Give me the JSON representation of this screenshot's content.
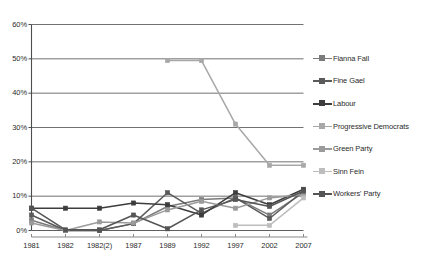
{
  "chart_data": {
    "type": "line",
    "title": "",
    "xlabel": "",
    "ylabel": "",
    "categories": [
      "1981",
      "1982",
      "1982(2)",
      "1987",
      "1989",
      "1992",
      "1997",
      "2002",
      "2007"
    ],
    "ylim": [
      0,
      60
    ],
    "ytick_labels": [
      "0%",
      "10%",
      "20%",
      "30%",
      "40%",
      "50%",
      "60%"
    ],
    "ytick_values": [
      0,
      10,
      20,
      30,
      40,
      50,
      60
    ],
    "grid": true,
    "legend_position": "right",
    "series": [
      {
        "name": "Fianna Fail",
        "color": "#7b7b7b",
        "values": [
          3.0,
          0.0,
          0.0,
          2.0,
          7.0,
          9.0,
          9.5,
          4.5,
          11.0
        ]
      },
      {
        "name": "Fine Gael",
        "color": "#5a5a5a",
        "values": [
          4.5,
          0.0,
          0.0,
          2.0,
          11.0,
          5.0,
          9.5,
          3.5,
          11.5
        ]
      },
      {
        "name": "Labour",
        "color": "#3d3d3d",
        "values": [
          6.5,
          6.5,
          6.5,
          8.0,
          7.5,
          4.5,
          11.0,
          7.5,
          12.0
        ]
      },
      {
        "name": "Progressive Democrats",
        "color": "#a8a8a8",
        "values": [
          null,
          null,
          null,
          null,
          49.5,
          49.5,
          31.0,
          19.0,
          19.0
        ]
      },
      {
        "name": "Green Party",
        "color": "#9b9b9b",
        "values": [
          2.2,
          0.0,
          2.5,
          2.2,
          6.0,
          8.5,
          6.5,
          9.5,
          10.5
        ]
      },
      {
        "name": "Sinn Fein",
        "color": "#bdbdbd",
        "values": [
          null,
          null,
          null,
          null,
          null,
          null,
          1.5,
          1.5,
          9.5
        ]
      },
      {
        "name": "Workers' Party",
        "color": "#555555",
        "values": [
          6.5,
          0.2,
          0.2,
          4.5,
          0.5,
          6.0,
          9.0,
          7.0,
          11.5
        ]
      }
    ]
  },
  "legend": {
    "items": [
      {
        "label": "Fianna Fall",
        "color": "#7b7b7b"
      },
      {
        "label": "Fine Gael",
        "color": "#5a5a5a"
      },
      {
        "label": "Labour",
        "color": "#3d3d3d"
      },
      {
        "label": "Progressive Democrats",
        "color": "#a8a8a8"
      },
      {
        "label": "Green Party",
        "color": "#9b9b9b"
      },
      {
        "label": "Sinn Fein",
        "color": "#bdbdbd"
      },
      {
        "label": "Workers' Party",
        "color": "#555555"
      }
    ]
  },
  "axes": {
    "y_labels": [
      "60%",
      "50%",
      "40%",
      "30%",
      "20%",
      "10%",
      "0%"
    ],
    "x_labels": [
      "1981",
      "1982",
      "1982(2)",
      "1987",
      "1989",
      "1992",
      "1997",
      "2002",
      "2007"
    ]
  }
}
